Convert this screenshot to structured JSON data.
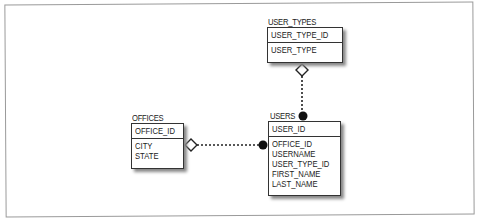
{
  "diagram": {
    "entities": [
      {
        "name": "USER_TYPES",
        "primary_key": [
          "USER_TYPE_ID"
        ],
        "attributes": [
          "USER_TYPE"
        ]
      },
      {
        "name": "OFFICES",
        "primary_key": [
          "OFFICE_ID"
        ],
        "attributes": [
          "CITY",
          "STATE"
        ]
      },
      {
        "name": "USERS",
        "primary_key": [
          "USER_ID"
        ],
        "attributes": [
          "OFFICE_ID",
          "USERNAME",
          "USER_TYPE_ID",
          "FIRST_NAME",
          "LAST_NAME"
        ]
      }
    ],
    "relationships": [
      {
        "from": "USER_TYPES",
        "to": "USERS",
        "style": "dotted",
        "from_end": "hollow-diamond",
        "to_end": "filled-circle"
      },
      {
        "from": "OFFICES",
        "to": "USERS",
        "style": "dotted",
        "from_end": "hollow-diamond",
        "to_end": "filled-circle"
      }
    ]
  }
}
